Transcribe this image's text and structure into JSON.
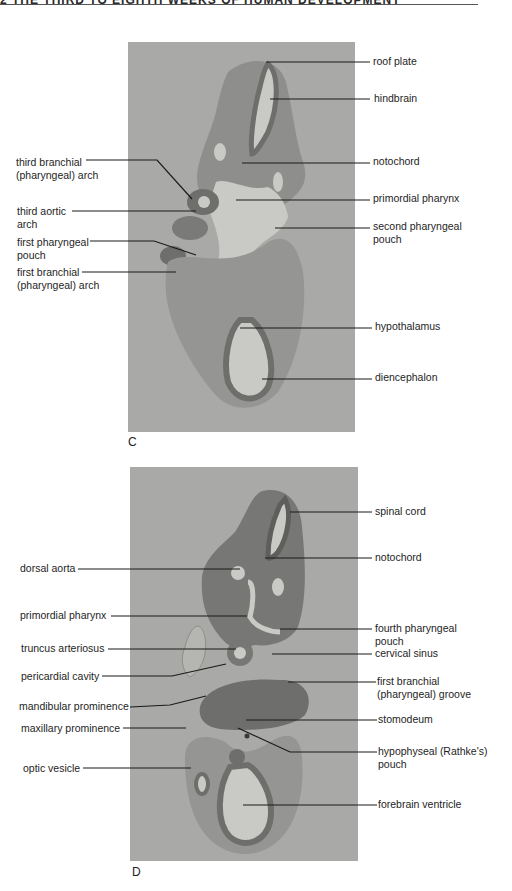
{
  "page": {
    "running_header": "2  THE THIRD TO EIGHTH WEEKS OF HUMAN DEVELOPMENT"
  },
  "figure": {
    "panels": [
      {
        "id": "C",
        "letter": "C",
        "labels_left": [
          {
            "line1": "third branchial",
            "line2": "(pharyngeal) arch"
          },
          {
            "line1": "third aortic",
            "line2": "arch"
          },
          {
            "line1": "first pharyngeal",
            "line2": "pouch"
          },
          {
            "line1": "first branchial",
            "line2": "(pharyngeal) arch"
          }
        ],
        "labels_right": [
          {
            "line1": "roof plate"
          },
          {
            "line1": "hindbrain"
          },
          {
            "line1": "notochord"
          },
          {
            "line1": "primordial pharynx"
          },
          {
            "line1": "second pharyngeal",
            "line2": "pouch"
          },
          {
            "line1": "hypothalamus"
          },
          {
            "line1": "diencephalon"
          }
        ]
      },
      {
        "id": "D",
        "letter": "D",
        "labels_left": [
          {
            "line1": "dorsal aorta"
          },
          {
            "line1": "primordial pharynx"
          },
          {
            "line1": "truncus arteriosus"
          },
          {
            "line1": "pericardial cavity"
          },
          {
            "line1": "mandibular prominence"
          },
          {
            "line1": "maxillary prominence"
          },
          {
            "line1": "optic vesicle"
          }
        ],
        "labels_right": [
          {
            "line1": "spinal cord"
          },
          {
            "line1": "notochord"
          },
          {
            "line1": "fourth pharyngeal",
            "line2": "pouch"
          },
          {
            "line1": "cervical sinus"
          },
          {
            "line1": "first branchial",
            "line2": "(pharyngeal) groove"
          },
          {
            "line1": "stomodeum"
          },
          {
            "line1": "hypophyseal (Rathke's)",
            "line2": "pouch"
          },
          {
            "line1": "forebrain ventricle"
          }
        ]
      }
    ]
  },
  "colors": {
    "micrograph_bg": "#a9a9a7",
    "tissue_light": "#8e8e8c",
    "tissue_dark": "#6e6e6c",
    "lumen": "#c9c9c6",
    "leader_line": "#1a1a1a"
  }
}
